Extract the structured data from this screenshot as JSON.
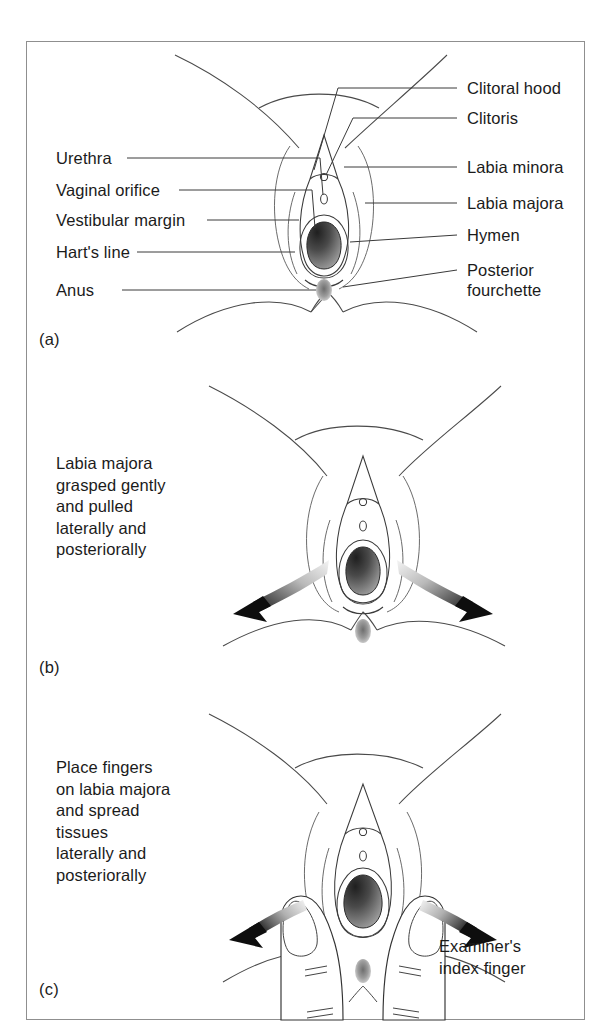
{
  "figure": {
    "domain": "medical-anatomy-diagram",
    "background_color": "#ffffff",
    "border_color": "#8f8f8f",
    "ink_color": "#1b1b1b"
  },
  "panel_a": {
    "tag": "(a)",
    "labels_left": [
      {
        "text": "Urethra",
        "target": "urethral-meatus"
      },
      {
        "text": "Vaginal orifice",
        "target": "vaginal-orifice"
      },
      {
        "text": "Vestibular margin",
        "target": "vestibular-margin"
      },
      {
        "text": "Hart's line",
        "target": "harts-line"
      },
      {
        "text": "Anus",
        "target": "anus"
      }
    ],
    "labels_right": [
      {
        "text": "Clitoral hood",
        "target": "clitoral-hood"
      },
      {
        "text": "Clitoris",
        "target": "clitoris"
      },
      {
        "text": "Labia minora",
        "target": "labia-minora"
      },
      {
        "text": "Labia majora",
        "target": "labia-majora"
      },
      {
        "text": "Hymen",
        "target": "hymen"
      },
      {
        "text": "Posterior",
        "target": "posterior-fourchette-line1"
      },
      {
        "text": "fourchette",
        "target": "posterior-fourchette-line2"
      }
    ]
  },
  "panel_b": {
    "tag": "(b)",
    "caption": "Labia majora\ngrasped gently\nand pulled\nlaterally and\nposteriorally",
    "arrows": [
      {
        "name": "left-traction-arrow",
        "direction": "down-left"
      },
      {
        "name": "right-traction-arrow",
        "direction": "down-right"
      }
    ]
  },
  "panel_c": {
    "tag": "(c)",
    "caption": "Place fingers\non labia majora\nand spread\ntissues\nlaterally and\nposteriorally",
    "annotation": "Examiner's\nindex finger",
    "annotation_line1": "Examiner's",
    "annotation_line2": "index finger",
    "arrows": [
      {
        "name": "left-spread-arrow",
        "direction": "left"
      },
      {
        "name": "right-spread-arrow",
        "direction": "right"
      }
    ]
  },
  "shading": {
    "vaginal_orifice_dark": "#2e2e2e",
    "vaginal_orifice_mid": "#7a7a7a",
    "hymen_ring": "#d8d8d8",
    "anus_stipple": "#9a9a9a",
    "arrow_gradient_from": "#f2f2f2",
    "arrow_gradient_to": "#111111"
  }
}
